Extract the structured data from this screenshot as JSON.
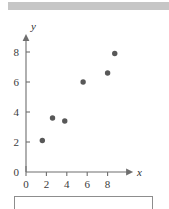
{
  "header": {
    "band_color": "#c6c6c6"
  },
  "caption_box": {
    "text": "",
    "border_color": "#8d8d8d"
  },
  "chart_data": {
    "type": "scatter",
    "title": "",
    "xlabel": "x",
    "ylabel": "y",
    "xlim": [
      0,
      10.5
    ],
    "ylim": [
      0,
      9.2
    ],
    "xticks": [
      0,
      2,
      4,
      6,
      8
    ],
    "yticks": [
      0,
      2,
      4,
      6,
      8
    ],
    "xtick_labels": [
      "0",
      "2",
      "4",
      "6",
      "8"
    ],
    "ytick_labels": [
      "0",
      "2",
      "4",
      "6",
      "8"
    ],
    "grid": false,
    "legend": false,
    "marker_color": "#585858",
    "axis_color": "#6e6e6e",
    "points": [
      {
        "x": 1.6,
        "y": 2.1
      },
      {
        "x": 2.6,
        "y": 3.6
      },
      {
        "x": 3.8,
        "y": 3.4
      },
      {
        "x": 5.6,
        "y": 6.0
      },
      {
        "x": 8.0,
        "y": 6.6
      },
      {
        "x": 8.7,
        "y": 7.9
      }
    ]
  }
}
